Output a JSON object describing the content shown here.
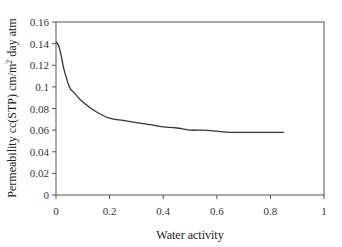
{
  "chart_data": {
    "type": "line",
    "title": "",
    "xlabel": "Water activity",
    "ylabel": "Permeability cc(STP) cm/m² day atm",
    "ylabel_parts": {
      "before": "Permeability cc(STP) cm/m",
      "sup": "2",
      "after": " day atm"
    },
    "xlim": [
      0,
      1
    ],
    "ylim": [
      0,
      0.16
    ],
    "x_ticks": [
      0,
      0.2,
      0.4,
      0.6,
      0.8,
      1
    ],
    "x_tick_labels": [
      "0",
      "0.2",
      "0.4",
      "0.6",
      "0.8",
      "1"
    ],
    "y_ticks": [
      0,
      0.02,
      0.04,
      0.06,
      0.08,
      0.1,
      0.12,
      0.14,
      0.16
    ],
    "y_tick_labels": [
      "0",
      "0.02",
      "0.04",
      "0.06",
      "0.08",
      "0.1",
      "0.12",
      "0.14",
      "0.16"
    ],
    "grid": false,
    "legend": null,
    "series": [
      {
        "name": "Permeability",
        "color": "#333333",
        "x": [
          0,
          0.01,
          0.02,
          0.03,
          0.05,
          0.07,
          0.1,
          0.15,
          0.2,
          0.25,
          0.3,
          0.35,
          0.4,
          0.45,
          0.5,
          0.55,
          0.6,
          0.65,
          0.7,
          0.75,
          0.8,
          0.85
        ],
        "y": [
          0.142,
          0.138,
          0.128,
          0.116,
          0.1,
          0.094,
          0.086,
          0.077,
          0.071,
          0.069,
          0.067,
          0.065,
          0.063,
          0.062,
          0.06,
          0.06,
          0.059,
          0.058,
          0.058,
          0.058,
          0.058,
          0.058
        ]
      }
    ]
  },
  "colors": {
    "axis": "#555555",
    "line": "#333333",
    "background": "#ffffff"
  }
}
